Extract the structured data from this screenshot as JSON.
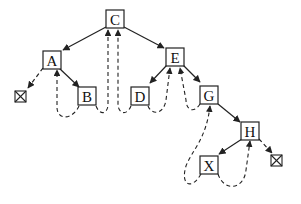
{
  "diagram": {
    "type": "threaded-binary-tree",
    "colors": {
      "stroke": "#222222",
      "box_fill": "#ffffff",
      "text": "#111111",
      "background": "#ffffff"
    },
    "nodes": [
      {
        "id": "C",
        "label": "C",
        "x": 115,
        "y": 19
      },
      {
        "id": "A",
        "label": "A",
        "x": 52,
        "y": 60
      },
      {
        "id": "E",
        "label": "E",
        "x": 175,
        "y": 57
      },
      {
        "id": "B",
        "label": "B",
        "x": 87,
        "y": 96
      },
      {
        "id": "D",
        "label": "D",
        "x": 140,
        "y": 96
      },
      {
        "id": "G",
        "label": "G",
        "x": 209,
        "y": 95
      },
      {
        "id": "H",
        "label": "H",
        "x": 250,
        "y": 131
      },
      {
        "id": "X",
        "label": "X",
        "x": 209,
        "y": 165
      }
    ],
    "null_markers": [
      {
        "id": "null-left-A",
        "x": 20,
        "y": 97
      },
      {
        "id": "null-right-H",
        "x": 277,
        "y": 160
      }
    ],
    "edges": [
      {
        "from": "C",
        "to": "A",
        "style": "solid"
      },
      {
        "from": "C",
        "to": "E",
        "style": "solid"
      },
      {
        "from": "A",
        "to": "B",
        "style": "solid"
      },
      {
        "from": "E",
        "to": "D",
        "style": "solid"
      },
      {
        "from": "E",
        "to": "G",
        "style": "solid"
      },
      {
        "from": "G",
        "to": "H",
        "style": "solid"
      },
      {
        "from": "H",
        "to": "X",
        "style": "solid"
      },
      {
        "from": "A",
        "to": "null-left-A",
        "style": "dashed"
      },
      {
        "from": "H",
        "to": "null-right-H",
        "style": "dashed"
      }
    ],
    "threads": [
      {
        "from": "B",
        "to": "A",
        "side": "left"
      },
      {
        "from": "B",
        "to": "C",
        "side": "right"
      },
      {
        "from": "D",
        "to": "C",
        "side": "left"
      },
      {
        "from": "D",
        "to": "E",
        "side": "right"
      },
      {
        "from": "G",
        "to": "E",
        "side": "left"
      },
      {
        "from": "X",
        "to": "G",
        "side": "left"
      },
      {
        "from": "X",
        "to": "H",
        "side": "right"
      }
    ]
  }
}
